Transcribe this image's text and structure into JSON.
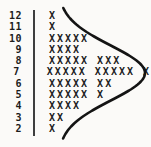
{
  "chart_data": {
    "type": "bar",
    "subtype": "dot-plot-tally",
    "orientation": "horizontal",
    "mark_symbol": "X",
    "title": "",
    "xlabel": "",
    "ylabel": "",
    "categories": [
      12,
      11,
      10,
      9,
      8,
      7,
      6,
      5,
      4,
      3,
      2
    ],
    "values": [
      1,
      1,
      5,
      4,
      8,
      11,
      7,
      6,
      4,
      2,
      1
    ],
    "row_texts": [
      "X",
      "X",
      "XXXXX",
      "XXXX",
      "XXXXX XXX",
      "XXXXX XXXXX X",
      "XXXXX XX",
      "XXXXX X",
      "XXXX",
      "XX",
      "X"
    ],
    "total_marks": 50,
    "grid": false,
    "legend": "none",
    "annotations": [
      "normal-distribution curve overlaid on the dot plot"
    ],
    "overlay_curve": {
      "shape": "bell",
      "base_x": 58,
      "amplitude": 87,
      "mu_y": 73,
      "sigma_y": 27.5,
      "y_start": 8,
      "y_end": 139,
      "stroke_width": 2.6
    }
  },
  "colors": {
    "background": "#fbfaf8",
    "mark": "#1c1c1c",
    "axis_line": "#3e3e3e",
    "curve": "#141414"
  }
}
